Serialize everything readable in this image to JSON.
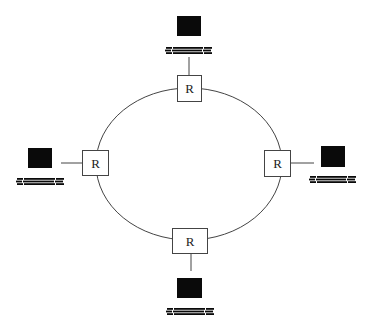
{
  "diagram": {
    "type": "ring-network",
    "colors": {
      "line": "#444444",
      "box_fill": "#ffffff",
      "box_stroke": "#444444",
      "monitor": "#0a0a0a",
      "background": "#ffffff"
    },
    "ring": {
      "cx": 189,
      "cy": 164,
      "rx": 93,
      "ry": 76
    },
    "routers": [
      {
        "id": "top",
        "label": "R",
        "x": 177,
        "y": 75,
        "w": 24,
        "h": 26
      },
      {
        "id": "left",
        "label": "R",
        "x": 82,
        "y": 150,
        "w": 26,
        "h": 25
      },
      {
        "id": "right",
        "label": "R",
        "x": 264,
        "y": 150,
        "w": 26,
        "h": 26
      },
      {
        "id": "bottom",
        "label": "R",
        "x": 172,
        "y": 228,
        "w": 35,
        "h": 25
      }
    ],
    "hosts": [
      {
        "id": "top",
        "icon": "computer-icon",
        "monitor": {
          "x": 177,
          "y": 16,
          "w": 24,
          "h": 20
        },
        "keyboard": {
          "x": 166,
          "y": 47,
          "w": 46
        },
        "link": {
          "x1": 189,
          "y1": 57,
          "x2": 189,
          "y2": 75
        }
      },
      {
        "id": "left",
        "icon": "computer-icon",
        "monitor": {
          "x": 28,
          "y": 148,
          "w": 24,
          "h": 20
        },
        "keyboard": {
          "x": 17,
          "y": 178,
          "w": 47
        },
        "link": {
          "x1": 61,
          "y1": 163,
          "x2": 82,
          "y2": 163
        }
      },
      {
        "id": "right",
        "icon": "computer-icon",
        "monitor": {
          "x": 321,
          "y": 146,
          "w": 24,
          "h": 21
        },
        "keyboard": {
          "x": 310,
          "y": 176,
          "w": 46
        },
        "link": {
          "x1": 290,
          "y1": 163,
          "x2": 314,
          "y2": 163
        }
      },
      {
        "id": "bottom",
        "icon": "computer-icon",
        "monitor": {
          "x": 177,
          "y": 278,
          "w": 25,
          "h": 20
        },
        "keyboard": {
          "x": 167,
          "y": 308,
          "w": 47
        },
        "link": {
          "x1": 191,
          "y1": 253,
          "x2": 191,
          "y2": 271
        }
      }
    ]
  }
}
